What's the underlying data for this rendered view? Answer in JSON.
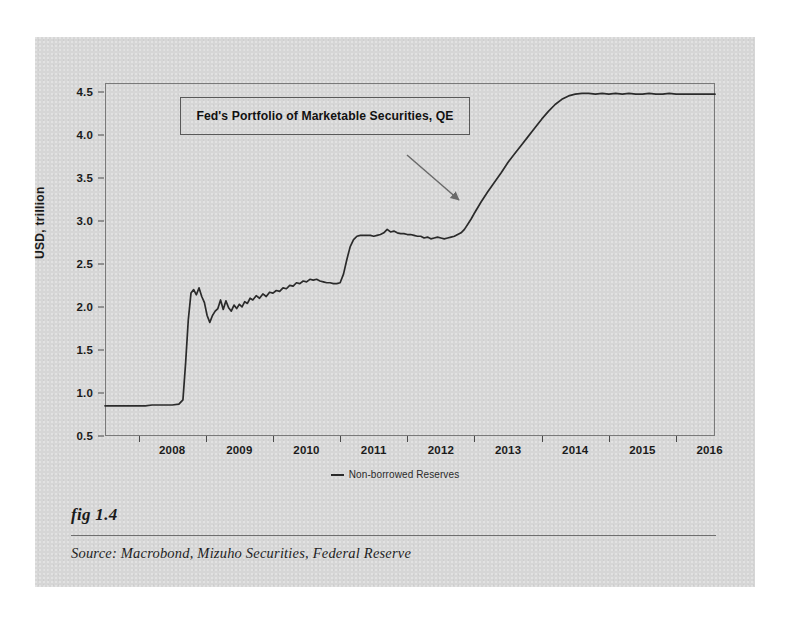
{
  "figure": {
    "number_label": "fig 1.4",
    "source_label": "Source:  Macrobond, Mizuho Securities, Federal Reserve"
  },
  "annotation": {
    "text": "Fed's Portfolio of Marketable Securities, QE",
    "arrow_name": "annotation-arrow"
  },
  "legend": {
    "entries": [
      {
        "label": "Non-borrowed Reserves",
        "color": "#2b2b2b"
      }
    ]
  },
  "colors": {
    "panel_background": "#d6d6d6",
    "series_line": "#2b2b2b",
    "axis": "#7a7a7a",
    "text": "#1b1b1b"
  },
  "chart_data": {
    "type": "line",
    "title": "",
    "annotation": "Fed's Portfolio of Marketable Securities, QE",
    "xlabel": "",
    "ylabel": "USD, trillion",
    "xlim": [
      2007.5,
      2016.58
    ],
    "ylim": [
      0.5,
      4.6
    ],
    "yticks": [
      0.5,
      1.0,
      1.5,
      2.0,
      2.5,
      3.0,
      3.5,
      4.0,
      4.5
    ],
    "ytick_labels": [
      "0.5",
      "1.0",
      "1.5",
      "2.0",
      "2.5",
      "3.0",
      "3.5",
      "4.0",
      "4.5"
    ],
    "xticks": [
      2008,
      2009,
      2010,
      2011,
      2012,
      2013,
      2014,
      2015,
      2016
    ],
    "xtick_labels": [
      "2008",
      "2009",
      "2010",
      "2011",
      "2012",
      "2013",
      "2014",
      "2015",
      "2016"
    ],
    "xtick_label_offset_years": 0.5,
    "grid": false,
    "legend_position": "bottom-center",
    "series": [
      {
        "name": "Non-borrowed Reserves",
        "color": "#2b2b2b",
        "x": [
          2007.5,
          2007.6,
          2007.7,
          2007.8,
          2007.9,
          2008.0,
          2008.1,
          2008.2,
          2008.3,
          2008.4,
          2008.5,
          2008.6,
          2008.66,
          2008.7,
          2008.74,
          2008.78,
          2008.82,
          2008.86,
          2008.9,
          2008.94,
          2008.98,
          2009.02,
          2009.06,
          2009.1,
          2009.14,
          2009.18,
          2009.22,
          2009.26,
          2009.3,
          2009.34,
          2009.38,
          2009.42,
          2009.46,
          2009.5,
          2009.54,
          2009.58,
          2009.62,
          2009.66,
          2009.7,
          2009.75,
          2009.8,
          2009.85,
          2009.9,
          2009.95,
          2010.0,
          2010.05,
          2010.1,
          2010.15,
          2010.2,
          2010.25,
          2010.3,
          2010.35,
          2010.4,
          2010.45,
          2010.5,
          2010.55,
          2010.6,
          2010.65,
          2010.7,
          2010.75,
          2010.8,
          2010.85,
          2010.9,
          2010.95,
          2011.0,
          2011.05,
          2011.1,
          2011.15,
          2011.2,
          2011.25,
          2011.3,
          2011.35,
          2011.4,
          2011.45,
          2011.5,
          2011.55,
          2011.6,
          2011.65,
          2011.7,
          2011.75,
          2011.8,
          2011.85,
          2011.9,
          2011.95,
          2012.0,
          2012.05,
          2012.1,
          2012.15,
          2012.2,
          2012.25,
          2012.3,
          2012.35,
          2012.4,
          2012.45,
          2012.5,
          2012.55,
          2012.6,
          2012.65,
          2012.7,
          2012.75,
          2012.8,
          2012.85,
          2012.9,
          2012.95,
          2013.0,
          2013.1,
          2013.2,
          2013.3,
          2013.4,
          2013.5,
          2013.6,
          2013.7,
          2013.8,
          2013.9,
          2014.0,
          2014.1,
          2014.2,
          2014.3,
          2014.4,
          2014.5,
          2014.6,
          2014.7,
          2014.8,
          2014.9,
          2015.0,
          2015.1,
          2015.2,
          2015.3,
          2015.4,
          2015.5,
          2015.6,
          2015.7,
          2015.8,
          2015.9,
          2016.0,
          2016.1,
          2016.2,
          2016.3,
          2016.4,
          2016.5,
          2016.58
        ],
        "y": [
          0.85,
          0.85,
          0.85,
          0.85,
          0.85,
          0.85,
          0.85,
          0.86,
          0.86,
          0.86,
          0.86,
          0.87,
          0.92,
          1.35,
          1.85,
          2.16,
          2.2,
          2.14,
          2.22,
          2.12,
          2.05,
          1.9,
          1.82,
          1.9,
          1.95,
          1.98,
          2.08,
          1.97,
          2.07,
          1.99,
          1.95,
          2.02,
          1.98,
          2.03,
          2.0,
          2.06,
          2.04,
          2.1,
          2.08,
          2.13,
          2.1,
          2.15,
          2.12,
          2.17,
          2.16,
          2.19,
          2.18,
          2.22,
          2.21,
          2.25,
          2.24,
          2.28,
          2.27,
          2.3,
          2.29,
          2.32,
          2.31,
          2.32,
          2.3,
          2.29,
          2.28,
          2.28,
          2.27,
          2.27,
          2.28,
          2.38,
          2.55,
          2.7,
          2.78,
          2.82,
          2.83,
          2.83,
          2.83,
          2.83,
          2.82,
          2.83,
          2.84,
          2.86,
          2.9,
          2.87,
          2.88,
          2.86,
          2.85,
          2.85,
          2.84,
          2.84,
          2.83,
          2.82,
          2.82,
          2.8,
          2.81,
          2.79,
          2.8,
          2.81,
          2.8,
          2.79,
          2.8,
          2.81,
          2.82,
          2.84,
          2.86,
          2.9,
          2.96,
          3.02,
          3.09,
          3.22,
          3.34,
          3.45,
          3.56,
          3.68,
          3.78,
          3.88,
          3.98,
          4.08,
          4.18,
          4.27,
          4.35,
          4.41,
          4.45,
          4.47,
          4.48,
          4.48,
          4.47,
          4.48,
          4.47,
          4.48,
          4.47,
          4.48,
          4.47,
          4.47,
          4.48,
          4.47,
          4.47,
          4.48,
          4.47,
          4.47,
          4.47,
          4.47,
          4.47,
          4.47,
          4.47
        ]
      }
    ]
  }
}
